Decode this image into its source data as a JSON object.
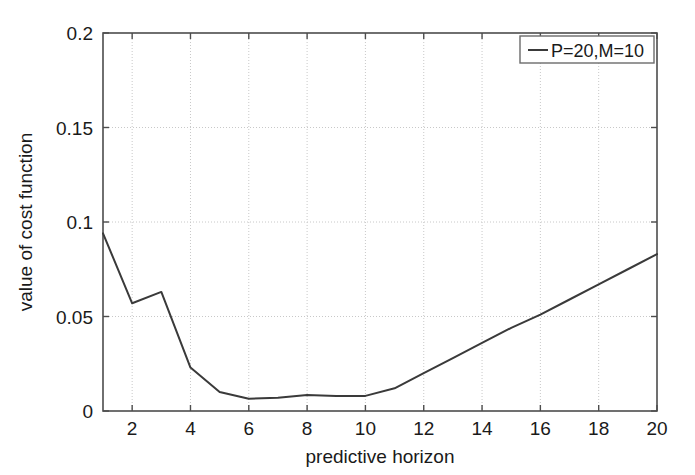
{
  "chart_data": {
    "type": "line",
    "title": "",
    "xlabel": "predictive horizon",
    "ylabel": "value of cost function",
    "xlim": [
      1,
      20
    ],
    "ylim": [
      0,
      0.2
    ],
    "grid": true,
    "legend_position": "top-right",
    "x_ticks": [
      "2",
      "4",
      "6",
      "8",
      "10",
      "12",
      "14",
      "16",
      "18",
      "20"
    ],
    "x_tick_values": [
      2,
      4,
      6,
      8,
      10,
      12,
      14,
      16,
      18,
      20
    ],
    "y_ticks": [
      "0",
      "0.05",
      "0.1",
      "0.15",
      "0.2"
    ],
    "y_tick_values": [
      0,
      0.05,
      0.1,
      0.15,
      0.2
    ],
    "series": [
      {
        "name": "P=20,M=10",
        "color": "#3a3a3a",
        "x": [
          1,
          2,
          3,
          4,
          5,
          6,
          7,
          8,
          9,
          10,
          11,
          12,
          13,
          14,
          15,
          16,
          17,
          18,
          19,
          20
        ],
        "values": [
          0.094,
          0.057,
          0.063,
          0.023,
          0.01,
          0.0065,
          0.007,
          0.0085,
          0.008,
          0.008,
          0.012,
          0.02,
          0.028,
          0.036,
          0.044,
          0.051,
          0.059,
          0.067,
          0.075,
          0.083
        ]
      }
    ]
  },
  "legend": {
    "entries": [
      {
        "label": "P=20,M=10"
      }
    ]
  },
  "axes": {
    "x_title": "predictive horizon",
    "y_title": "value of cost function"
  }
}
